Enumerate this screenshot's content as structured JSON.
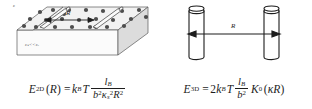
{
  "figure": {
    "panels": [
      {
        "id": "two-dimensional",
        "diagram": {
          "type": "slab-with-rods",
          "distance_label": "R",
          "outside_permittivity_label": "ε",
          "inside_permittivity_label": "εₛ<<εᵥ",
          "rod_count": 2,
          "counterion_count": 24
        },
        "equation": {
          "lhs_symbol": "E",
          "lhs_subscript": "2D",
          "lhs_argument": "(R)",
          "equals": "=",
          "prefactor": "k",
          "prefactor_subscript": "B",
          "temperature": "T",
          "numerator": "l",
          "numerator_subscript": "B",
          "denominator_b": "b",
          "denominator_b_exp": "2",
          "denominator_kappa": "κ",
          "denominator_kappa_subscript": "s",
          "denominator_kappa_exp": "2",
          "denominator_R": "R",
          "denominator_R_exp": "2"
        }
      },
      {
        "id": "three-dimensional",
        "diagram": {
          "type": "two-cylinders",
          "distance_label": "R",
          "cylinder_count": 2
        },
        "equation": {
          "lhs_symbol": "E",
          "lhs_subscript": "3D",
          "equals": "=",
          "coefficient": "2",
          "prefactor": "k",
          "prefactor_subscript": "B",
          "temperature": "T",
          "numerator": "l",
          "numerator_subscript": "B",
          "denominator_b": "b",
          "denominator_b_exp": "2",
          "bessel_symbol": "K",
          "bessel_order": "0",
          "bessel_open": "(",
          "bessel_kappa": "κ",
          "bessel_R": "R",
          "bessel_close": ")"
        }
      }
    ]
  },
  "colors": {
    "background": "#ffffff",
    "ink": "#1d1d1d",
    "slab_top": "#f2f2f2",
    "slab_side": "#dcdcdc",
    "slab_front": "#fbfbfb",
    "counterion": "#4d4d4d",
    "rod_fill": "#fafafa"
  }
}
